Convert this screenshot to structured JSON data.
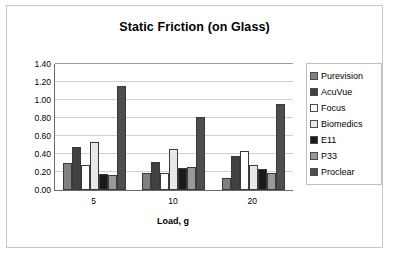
{
  "chart_data": {
    "type": "bar",
    "title": "Static Friction (on Glass)",
    "xlabel": "Load, g",
    "ylabel": "",
    "categories": [
      "5",
      "10",
      "20"
    ],
    "ylim": [
      0.0,
      1.4
    ],
    "yticks": [
      "1.40",
      "1.20",
      "1.00",
      "0.80",
      "0.60",
      "0.40",
      "0.20",
      "0.00"
    ],
    "ytick_values": [
      1.4,
      1.2,
      1.0,
      0.8,
      0.6,
      0.4,
      0.2,
      0.0
    ],
    "grid": true,
    "legend_position": "right",
    "series": [
      {
        "name": "Purevision",
        "color": "#808080",
        "values": [
          0.3,
          0.19,
          0.13
        ]
      },
      {
        "name": "AcuVue",
        "color": "#404040",
        "values": [
          0.48,
          0.31,
          0.38
        ]
      },
      {
        "name": "Focus",
        "color": "#ffffff",
        "values": [
          0.28,
          0.19,
          0.43
        ]
      },
      {
        "name": "Biomedics",
        "color": "#e8e8e8",
        "values": [
          0.53,
          0.46,
          0.28
        ]
      },
      {
        "name": "E11",
        "color": "#1a1a1a",
        "values": [
          0.18,
          0.25,
          0.235
        ]
      },
      {
        "name": "P33",
        "color": "#999999",
        "values": [
          0.17,
          0.255,
          0.19
        ]
      },
      {
        "name": "Proclear",
        "color": "#4d4d4d",
        "values": [
          1.16,
          0.81,
          0.96
        ]
      }
    ]
  },
  "legend": {
    "items": [
      {
        "label": "Purevision"
      },
      {
        "label": "AcuVue"
      },
      {
        "label": "Focus"
      },
      {
        "label": "Biomedics"
      },
      {
        "label": "E11"
      },
      {
        "label": "P33"
      },
      {
        "label": "Proclear"
      }
    ]
  }
}
